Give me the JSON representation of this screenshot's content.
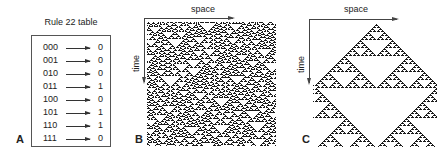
{
  "panel_a": {
    "letter": "A",
    "title": "Rule 22 table",
    "rows": [
      {
        "input": "000",
        "output": "0"
      },
      {
        "input": "001",
        "output": "0"
      },
      {
        "input": "010",
        "output": "0"
      },
      {
        "input": "011",
        "output": "1"
      },
      {
        "input": "100",
        "output": "0"
      },
      {
        "input": "101",
        "output": "1"
      },
      {
        "input": "110",
        "output": "1"
      },
      {
        "input": "111",
        "output": "0"
      }
    ]
  },
  "panel_b": {
    "letter": "B",
    "x_axis_label": "space",
    "y_axis_label": "time",
    "initial_condition": "random"
  },
  "panel_c": {
    "letter": "C",
    "x_axis_label": "space",
    "y_axis_label": "time",
    "initial_condition": "single-cell"
  },
  "colors": {
    "cell_on": "#1a1a1a",
    "background": "#ffffff"
  }
}
